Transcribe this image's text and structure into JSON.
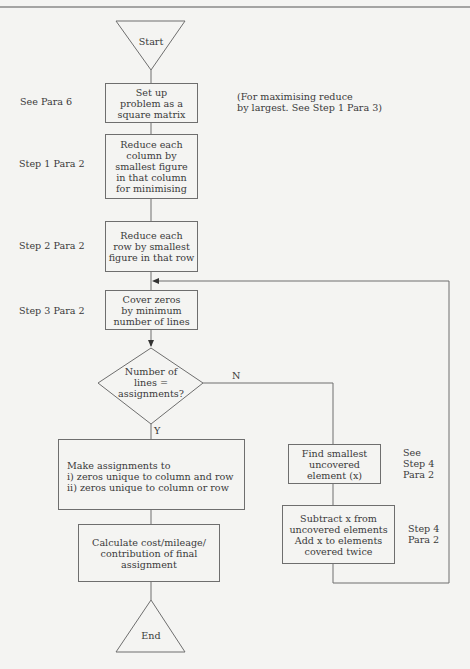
{
  "diagram": {
    "nodes": {
      "start": "Start",
      "setup": "Set up\nproblem as a\nsquare matrix",
      "reduce_columns": "Reduce each\ncolumn by\nsmallest figure\nin that column\nfor minimising",
      "reduce_rows": "Reduce each\nrow by smallest\nfigure in that row",
      "cover_zeros": "Cover zeros\nby minimum\nnumber of lines",
      "decision": "Number of\nlines =\nassignments?",
      "make_assignments": "Make assignments to\ni)   zeros unique to column and row\nii)  zeros unique to column or row",
      "calculate": "Calculate cost/mileage/\ncontribution of final\nassignment",
      "end": "End",
      "find_smallest": "Find smallest\nuncovered\nelement (x)",
      "subtract": "Subtract x from\nuncovered elements\nAdd x to elements\ncovered twice"
    },
    "branch_labels": {
      "no": "N",
      "yes": "Y"
    },
    "references": {
      "setup": "See Para 6",
      "reduce_columns": "Step 1 Para 2",
      "reduce_rows": "Step 2 Para 2",
      "cover_zeros": "Step 3 Para 2",
      "find_smallest": "See\nStep 4\nPara 2",
      "subtract": "Step 4\nPara 2"
    },
    "note": "(For maximising reduce\nby largest. See Step 1 Para 3)"
  }
}
